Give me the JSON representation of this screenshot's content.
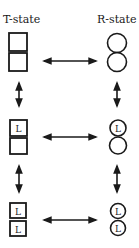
{
  "diagram": {
    "columns": [
      {
        "id": "t",
        "title": "T-state",
        "subunit_shape": "square"
      },
      {
        "id": "r",
        "title": "R-state",
        "subunit_shape": "circle"
      }
    ],
    "rows": [
      {
        "ligands_bound": 0,
        "t_subunits": [
          "",
          ""
        ],
        "r_subunits": [
          "",
          ""
        ]
      },
      {
        "ligands_bound": 1,
        "t_subunits": [
          "L",
          ""
        ],
        "r_subunits": [
          "L",
          ""
        ]
      },
      {
        "ligands_bound": 2,
        "t_subunits": [
          "L",
          "L"
        ],
        "r_subunits": [
          "L",
          "L"
        ]
      }
    ],
    "ligand_label": "L",
    "arrows": {
      "horizontal": "double-headed arrow between T and R states in each row",
      "vertical": "double-headed arrows between successive ligation states in each column"
    },
    "colors": {
      "stroke": "#1a1a1a",
      "background": "#ffffff"
    }
  }
}
